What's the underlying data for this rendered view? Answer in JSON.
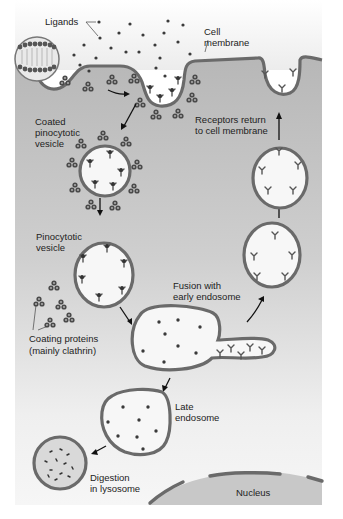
{
  "figure": {
    "labels": {
      "ligands": "Ligands",
      "cell_membrane_1": "Cell",
      "cell_membrane_2": "membrane",
      "coated_vesicle_1": "Coated",
      "coated_vesicle_2": "pinocytotic",
      "coated_vesicle_3": "vesicle",
      "receptors_return_1": "Receptors return",
      "receptors_return_2": "to cell membrane",
      "pinocytotic_vesicle_1": "Pinocytotic",
      "pinocytotic_vesicle_2": "vesicle",
      "fusion_1": "Fusion with",
      "fusion_2": "early endosome",
      "coating_proteins_1": "Coating proteins",
      "coating_proteins_2": "(mainly clathrin)",
      "late_endosome_1": "Late",
      "late_endosome_2": "endosome",
      "digestion_1": "Digestion",
      "digestion_2": "in lysosome",
      "nucleus": "Nucleus"
    },
    "colors": {
      "cytoplasm_top": "#b9b9b9",
      "cytoplasm_bottom": "#f4f4f4",
      "membrane": "#6a6a6a",
      "vesicle_fill": "#f7f7f7",
      "nucleus_fill": "#c8c8c8",
      "ligand": "#3a3a3a",
      "clathrin": "#4a4a4a",
      "text": "#222222"
    }
  }
}
